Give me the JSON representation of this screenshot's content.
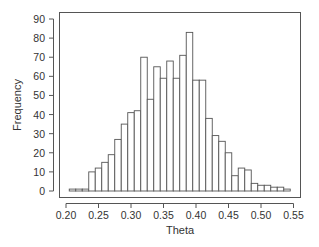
{
  "chart_data": {
    "type": "bar",
    "subtype": "histogram",
    "title": "",
    "xlabel": "Theta",
    "ylabel": "Frequency",
    "bin_start": 0.205,
    "bin_width": 0.01,
    "bin_edges": [
      0.205,
      0.215,
      0.225,
      0.235,
      0.245,
      0.255,
      0.265,
      0.275,
      0.285,
      0.295,
      0.305,
      0.315,
      0.325,
      0.335,
      0.345,
      0.355,
      0.365,
      0.375,
      0.385,
      0.395,
      0.405,
      0.415,
      0.425,
      0.435,
      0.445,
      0.455,
      0.465,
      0.475,
      0.485,
      0.495,
      0.505,
      0.515,
      0.525,
      0.535,
      0.545
    ],
    "values": [
      1,
      1,
      1,
      10,
      12,
      15,
      19,
      27,
      35,
      41,
      42,
      70,
      48,
      65,
      59,
      68,
      59,
      71,
      83,
      58,
      58,
      38,
      29,
      26,
      20,
      8,
      12,
      11,
      4,
      3,
      3,
      2,
      2,
      1
    ],
    "xlim": [
      0.19,
      0.56
    ],
    "ylim": [
      -4,
      94
    ],
    "x_ticks": [
      0.2,
      0.25,
      0.3,
      0.35,
      0.4,
      0.45,
      0.5,
      0.55
    ],
    "x_tick_labels": [
      "0.20",
      "0.25",
      "0.30",
      "0.35",
      "0.40",
      "0.45",
      "0.50",
      "0.55"
    ],
    "y_ticks": [
      0,
      10,
      20,
      30,
      40,
      50,
      60,
      70,
      80,
      90
    ],
    "y_tick_labels": [
      "0",
      "10",
      "20",
      "30",
      "40",
      "50",
      "60",
      "70",
      "80",
      "90"
    ],
    "grid": false,
    "legend": null,
    "colors": {
      "bar_fill": "#ffffff",
      "bar_edge": "#555555",
      "axis": "#555555",
      "text": "#333333"
    }
  }
}
